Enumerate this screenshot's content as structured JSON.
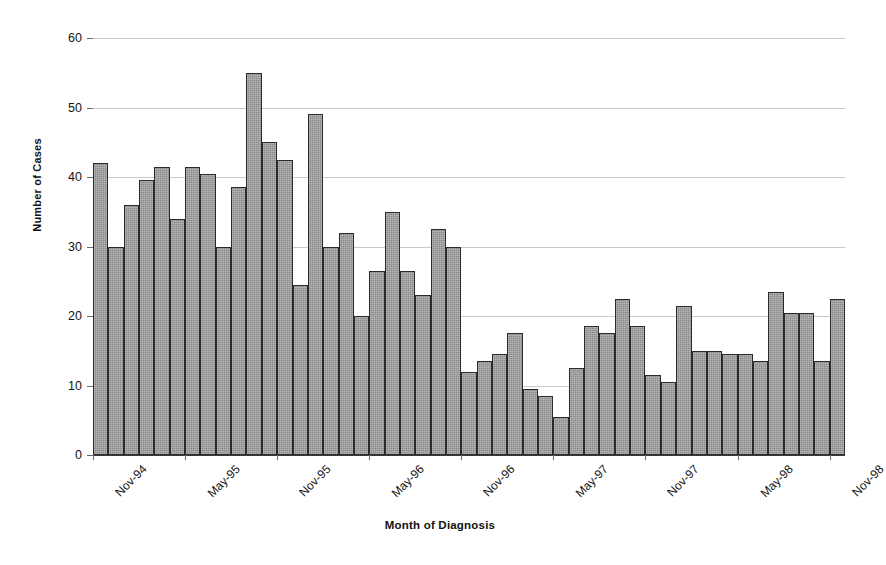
{
  "chart_data": {
    "type": "bar",
    "title": "",
    "xlabel": "Month of Diagnosis",
    "ylabel": "Number of Cases",
    "ylim": [
      0,
      60
    ],
    "ytick_step": 10,
    "yticks": [
      0,
      10,
      20,
      30,
      40,
      50,
      60
    ],
    "grid": true,
    "legend": "none",
    "bar_color": "#8a8a8a",
    "bar_edge_color": "#2b2b2b",
    "gridline_color": "#c9c9c9",
    "axis_color": "#3a3a3a",
    "categories": [
      "Nov-94",
      "Dec-94",
      "Jan-95",
      "Feb-95",
      "Mar-95",
      "Apr-95",
      "May-95",
      "Jun-95",
      "Jul-95",
      "Aug-95",
      "Sep-95",
      "Oct-95",
      "Nov-95",
      "Dec-95",
      "Jan-96",
      "Feb-96",
      "Mar-96",
      "Apr-96",
      "May-96",
      "Jun-96",
      "Jul-96",
      "Aug-96",
      "Sep-96",
      "Oct-96",
      "Nov-96",
      "Dec-96",
      "Jan-97",
      "Feb-97",
      "Mar-97",
      "Apr-97",
      "May-97",
      "Jun-97",
      "Jul-97",
      "Aug-97",
      "Sep-97",
      "Oct-97",
      "Nov-97",
      "Dec-97",
      "Jan-98",
      "Feb-98",
      "Mar-98",
      "Apr-98",
      "May-98",
      "Jun-98",
      "Jul-98",
      "Aug-98",
      "Sep-98",
      "Oct-98",
      "Nov-98"
    ],
    "values": [
      42,
      30,
      36,
      39.5,
      41.5,
      34,
      41.5,
      40.5,
      30,
      38.5,
      55,
      45,
      42.5,
      24.5,
      49,
      30,
      32,
      20,
      26.5,
      35,
      26.5,
      23,
      32.5,
      30,
      12,
      13.5,
      14.5,
      17.5,
      9.5,
      8.5,
      5.5,
      12.5,
      18.5,
      17.5,
      22.5,
      18.5,
      11.5,
      10.5,
      21.5,
      15,
      15,
      14.5,
      14.5,
      13.5,
      23.5,
      20.5,
      20.5,
      13.5,
      22.5
    ],
    "last_bar_value": 8.5,
    "xtick_labels": [
      "Nov-94",
      "May-95",
      "Nov-95",
      "May-96",
      "Nov-96",
      "May-97",
      "Nov-97",
      "May-98",
      "Nov-98"
    ],
    "xtick_indices": [
      0,
      6,
      12,
      18,
      24,
      30,
      36,
      42,
      48
    ]
  }
}
